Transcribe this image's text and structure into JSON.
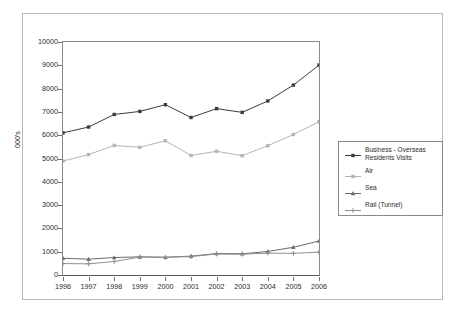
{
  "chart_data": {
    "type": "line",
    "title": "",
    "subtitle": "",
    "xlabel": "",
    "ylabel": "000's",
    "categories": [
      "1996",
      "1997",
      "1998",
      "1999",
      "2000",
      "2001",
      "2002",
      "2003",
      "2004",
      "2005",
      "2006"
    ],
    "x": [
      1996,
      1997,
      1998,
      1999,
      2000,
      2001,
      2002,
      2003,
      2004,
      2005,
      2006
    ],
    "xlim": [
      1996,
      2006
    ],
    "ylim": [
      0,
      10000
    ],
    "y_ticks": [
      0,
      1000,
      2000,
      3000,
      4000,
      5000,
      6000,
      7000,
      8000,
      9000,
      10000
    ],
    "y_tick_labels": [
      "0",
      "1000",
      "2000",
      "3000",
      "4000",
      "5000",
      "6000",
      "7000",
      "8000",
      "9000",
      "10000"
    ],
    "grid": false,
    "legend_position": "right",
    "series": [
      {
        "name": "Business - Overseas Residents Visits",
        "color": "#3c3c3c",
        "marker": "square",
        "values": [
          6100,
          6350,
          6890,
          7020,
          7310,
          6760,
          7140,
          6980,
          7470,
          8150,
          9010
        ]
      },
      {
        "name": "Air",
        "color": "#b4b4b4",
        "marker": "square",
        "values": [
          4890,
          5170,
          5560,
          5480,
          5760,
          5130,
          5310,
          5120,
          5550,
          6030,
          6580
        ]
      },
      {
        "name": "Sea",
        "color": "#6b6b6b",
        "marker": "triangle",
        "values": [
          720,
          680,
          750,
          780,
          760,
          810,
          920,
          910,
          1010,
          1190,
          1460
        ]
      },
      {
        "name": "Rail (Tunnel)",
        "color": "#8f8f8f",
        "marker": "cross",
        "values": [
          490,
          480,
          580,
          770,
          760,
          790,
          900,
          890,
          940,
          930,
          980
        ]
      }
    ]
  },
  "legend": {
    "entries": [
      {
        "label": "Business - Overseas\nResidents Visits"
      },
      {
        "label": "Air"
      },
      {
        "label": "Sea"
      },
      {
        "label": "Rail (Tunnel)"
      }
    ]
  },
  "axes": {
    "y_title": "000's"
  },
  "colors": {
    "frame": "#b9b9b9",
    "plot_border": "#8a8a8a",
    "axis": "#555555",
    "text": "#2b2b2b",
    "background": "#ffffff"
  }
}
